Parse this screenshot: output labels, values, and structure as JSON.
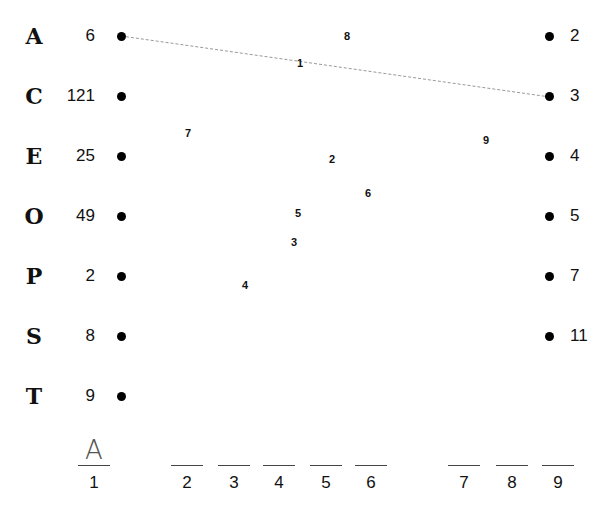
{
  "left_column": [
    {
      "letter": "A",
      "value": "6",
      "y": 36
    },
    {
      "letter": "C",
      "value": "121",
      "y": 96
    },
    {
      "letter": "E",
      "value": "25",
      "y": 156
    },
    {
      "letter": "O",
      "value": "49",
      "y": 216
    },
    {
      "letter": "P",
      "value": "2",
      "y": 276
    },
    {
      "letter": "S",
      "value": "8",
      "y": 336
    },
    {
      "letter": "T",
      "value": "9",
      "y": 396
    }
  ],
  "right_column": [
    {
      "value": "2",
      "y": 36
    },
    {
      "value": "3",
      "y": 96
    },
    {
      "value": "4",
      "y": 156
    },
    {
      "value": "5",
      "y": 216
    },
    {
      "value": "7",
      "y": 276
    },
    {
      "value": "11",
      "y": 336
    }
  ],
  "connection": {
    "from": "A (6)",
    "to": "3",
    "style": "dotted",
    "color": "#999999"
  },
  "floating_numbers": [
    {
      "label": "8",
      "x": 347,
      "y": 36
    },
    {
      "label": "1",
      "x": 300,
      "y": 63
    },
    {
      "label": "7",
      "x": 188,
      "y": 133
    },
    {
      "label": "9",
      "x": 486,
      "y": 140
    },
    {
      "label": "2",
      "x": 332,
      "y": 159
    },
    {
      "label": "6",
      "x": 368,
      "y": 193
    },
    {
      "label": "5",
      "x": 298,
      "y": 213
    },
    {
      "label": "3",
      "x": 294,
      "y": 242
    },
    {
      "label": "4",
      "x": 245,
      "y": 285
    }
  ],
  "answer_slots": [
    {
      "number": "1",
      "answer": "A",
      "x": 78
    },
    {
      "number": "2",
      "answer": "",
      "x": 171
    },
    {
      "number": "3",
      "answer": "",
      "x": 218
    },
    {
      "number": "4",
      "answer": "",
      "x": 263
    },
    {
      "number": "5",
      "answer": "",
      "x": 310
    },
    {
      "number": "6",
      "answer": "",
      "x": 355
    },
    {
      "number": "7",
      "answer": "",
      "x": 448
    },
    {
      "number": "8",
      "answer": "",
      "x": 496
    },
    {
      "number": "9",
      "answer": "",
      "x": 542
    }
  ]
}
